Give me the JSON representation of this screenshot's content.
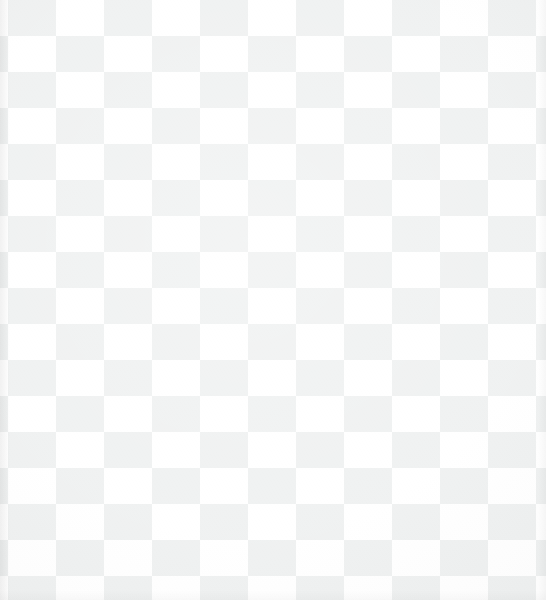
{
  "image": {
    "kind": "checkerboard-texture",
    "description": "Photograph of a white and light-grey checkerboard-patterned woven fabric filling the entire frame",
    "width_px": 546,
    "height_px": 600,
    "has_text": false,
    "has_ui_chrome": false
  },
  "pattern": {
    "name": "checkerboard",
    "cell_width_px": 48,
    "cell_height_px": 36,
    "tile_width_px": 96,
    "tile_height_px": 72,
    "origin_offset_x_px": 8,
    "origin_offset_y_px": 0,
    "columns_visible": 12,
    "rows_visible": 17,
    "light_color": "#ffffff",
    "dark_color": "#eef0f0",
    "first_cell_at_origin": "dark-partial"
  },
  "texture": {
    "material": "woven fabric",
    "weave_direction": "orthogonal",
    "thread_pitch_px": 2,
    "texture_opacity": 0.55,
    "visible_on": "dark-cells"
  },
  "lighting": {
    "type": "soft-diffuse",
    "highlight_center_x_pct": 45,
    "highlight_center_y_pct": 40,
    "vignette_strength": 0.045,
    "left_edge_shade": "#00000010",
    "right_edge_shade": "#00000008",
    "bottom_edge_shade": "#00000006"
  },
  "layers": [
    {
      "label": "checker base"
    },
    {
      "label": "weave texture"
    },
    {
      "label": "lighting vignette"
    },
    {
      "label": "left edge shade"
    },
    {
      "label": "right edge shade"
    },
    {
      "label": "bottom edge shade"
    }
  ]
}
